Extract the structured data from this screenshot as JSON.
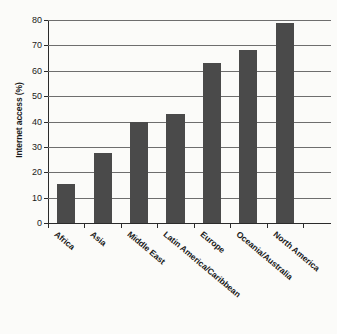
{
  "chart_data": {
    "type": "bar",
    "title": "",
    "xlabel": "",
    "ylabel": "Internet access (%)",
    "ylim": [
      0,
      80
    ],
    "yticks": [
      0,
      10,
      20,
      30,
      40,
      50,
      60,
      70,
      80
    ],
    "grid": true,
    "legend": "none",
    "bar_color": "#4a4a4a",
    "categories": [
      "Africa",
      "Asia",
      "Middle East",
      "Latin America/Caribbean",
      "Europe",
      "Oceania/Australia",
      "North America"
    ],
    "values": [
      15.5,
      27.5,
      40,
      43,
      63,
      68,
      79
    ]
  }
}
